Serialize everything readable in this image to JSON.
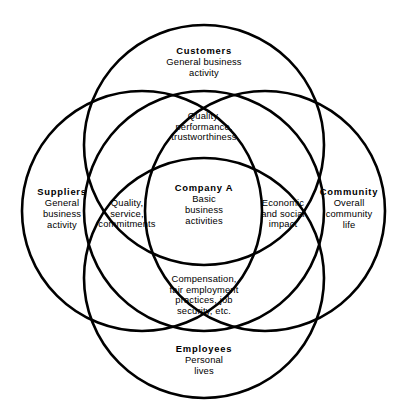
{
  "diagram": {
    "type": "venn",
    "canvas": {
      "width": 408,
      "height": 420
    },
    "style": {
      "stroke_color": "#000000",
      "fill_color": "#ffffff",
      "background": "#ffffff",
      "stroke_width": 2.6,
      "radius": 120
    },
    "circles": [
      {
        "name": "customers",
        "cx": 204,
        "cy": 145,
        "r": 120
      },
      {
        "name": "suppliers",
        "cx": 142,
        "cy": 211,
        "r": 120
      },
      {
        "name": "company",
        "cx": 204,
        "cy": 211,
        "r": 120
      },
      {
        "name": "community",
        "cx": 265,
        "cy": 211,
        "r": 120
      },
      {
        "name": "employees",
        "cx": 204,
        "cy": 278,
        "r": 120
      }
    ],
    "regions": {
      "customers": {
        "title": "Customers",
        "lines": [
          "General business",
          "activity"
        ]
      },
      "customers_overlap": {
        "title": "",
        "lines": [
          "Quality,",
          "performance,",
          "trustworthiness"
        ]
      },
      "suppliers": {
        "title": "Suppliers",
        "lines": [
          "General",
          "business",
          "activity"
        ]
      },
      "suppliers_overlap": {
        "title": "",
        "lines": [
          "Quality,",
          "service,",
          "commitments"
        ]
      },
      "company": {
        "title": "Company A",
        "lines": [
          "Basic",
          "business",
          "activities"
        ]
      },
      "community_overlap": {
        "title": "",
        "lines": [
          "Economic",
          "and social",
          "impact"
        ]
      },
      "community": {
        "title": "Community",
        "lines": [
          "Overall",
          "community",
          "life"
        ]
      },
      "employees_overlap": {
        "title": "",
        "lines": [
          "Compensation,",
          "fair  employment",
          "practices,  job",
          "security,  etc."
        ]
      },
      "employees": {
        "title": "Employees",
        "lines": [
          "Personal",
          "lives"
        ]
      }
    }
  }
}
